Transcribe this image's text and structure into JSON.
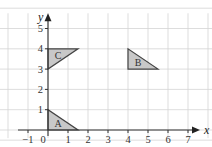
{
  "diagram": {
    "type": "coordinate-grid-shapes",
    "x_axis": {
      "label": "x",
      "min": -1,
      "max": 7,
      "tick_labels": [
        "-1",
        "0",
        "1",
        "2",
        "3",
        "4",
        "5",
        "6",
        "7"
      ]
    },
    "y_axis": {
      "label": "y",
      "min": 0,
      "max": 5,
      "tick_labels": [
        "1",
        "2",
        "3",
        "4",
        "5"
      ]
    },
    "grid": true,
    "shapes": [
      {
        "name": "A",
        "vertices": [
          [
            0,
            0
          ],
          [
            0,
            1
          ],
          [
            1.5,
            0
          ]
        ],
        "fill": "#c8c8c8"
      },
      {
        "name": "B",
        "vertices": [
          [
            4,
            4
          ],
          [
            4,
            3
          ],
          [
            5.5,
            3
          ]
        ],
        "fill": "#c8c8c8"
      },
      {
        "name": "C",
        "vertices": [
          [
            0,
            4
          ],
          [
            0,
            3
          ],
          [
            1.5,
            4
          ]
        ],
        "fill": "#c8c8c8"
      }
    ]
  }
}
